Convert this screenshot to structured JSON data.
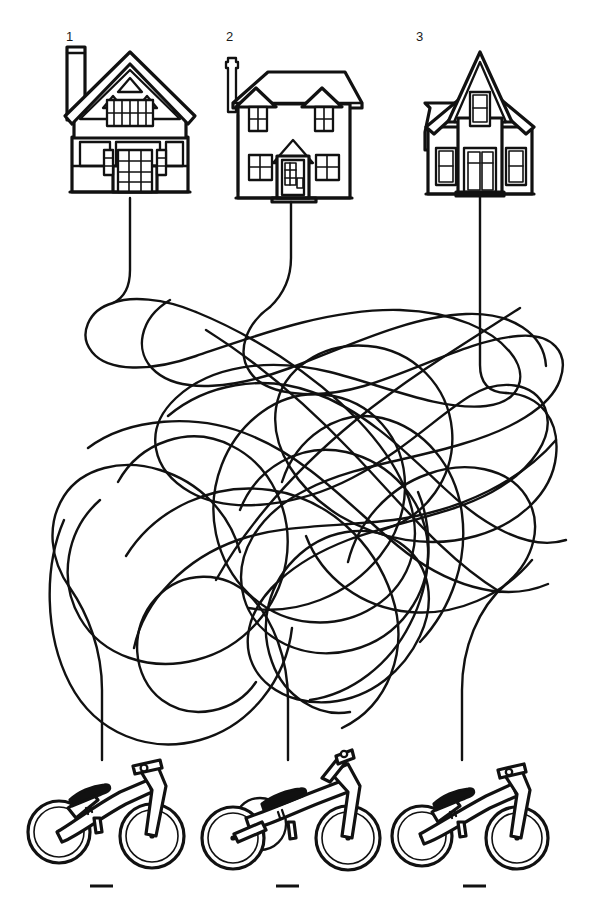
{
  "puzzle": {
    "type": "tangled-lines-matching",
    "description": "Follow the tangled lines from each numbered house to find its matching balance bike.",
    "background_color": "#ffffff",
    "ink_color": "#111111"
  },
  "houses": [
    {
      "number": "1",
      "name": "tudor-gable-house",
      "style": "Tudor gable house with left chimney, decorative gable trusses, upper window band and multi-pane door",
      "label_x": 66,
      "label_y": 30
    },
    {
      "number": "2",
      "name": "colonial-dormer-house",
      "style": "Colonial house with two roof dormers, slim left chimney, four windows and a gabled porch door",
      "label_x": 226,
      "label_y": 30
    },
    {
      "number": "3",
      "name": "victorian-farmhouse",
      "style": "Victorian farmhouse with steep central gable, gable window, two side windows and central door",
      "label_x": 416,
      "label_y": 30
    }
  ],
  "bikes": [
    {
      "name": "balance-bike-left",
      "style": "two-wheel balance bike, seat at left, fork at right"
    },
    {
      "name": "balance-trike-middle",
      "style": "three-wheel balance trike with twin rear wheels"
    },
    {
      "name": "balance-bike-right",
      "style": "two-wheel balance bike, compact frame"
    }
  ],
  "answer_blanks": [
    {
      "name": "answer-blank-1",
      "value": ""
    },
    {
      "name": "answer-blank-2",
      "value": ""
    },
    {
      "name": "answer-blank-3",
      "value": ""
    }
  ]
}
